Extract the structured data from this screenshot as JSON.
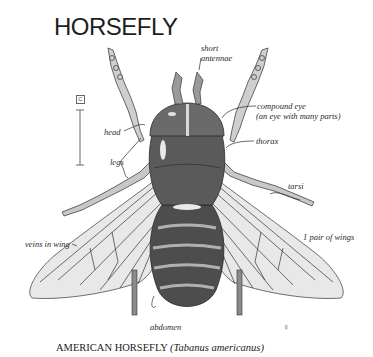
{
  "title": "HORSEFLY",
  "scale_marker": "C",
  "labels": {
    "short_antennae": "short\nantennae",
    "short_antennae_l1": "short",
    "short_antennae_l2": "antennae",
    "compound_eye": "compound eye",
    "compound_eye_note": "(an eye with many parts)",
    "thorax": "thorax",
    "head": "head",
    "legs": "legs",
    "tarsi": "tarsi",
    "veins_in_wing": "veins in wing",
    "pair_of_wings": "1 pair of wings",
    "abdomen": "abdomen",
    "sex_symbol": "♀"
  },
  "caption": {
    "common_name": "AMERICAN HORSEFLY",
    "scientific_name": "(Tabanus americanus)"
  },
  "colors": {
    "ink": "#2a2a2a",
    "body_dark": "#4a4a4a",
    "body_mid": "#7a7a7a",
    "wing_fill": "#e6e6e6",
    "band_light": "#b8b8b8"
  }
}
